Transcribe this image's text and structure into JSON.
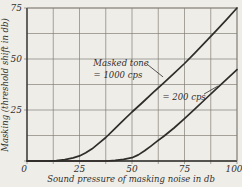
{
  "figure": {
    "paper_color": "#efede8",
    "ink_color": "#2f2d2a",
    "grid_color": "#827f76"
  },
  "chart_data": {
    "type": "line",
    "title": "",
    "xlabel": "Sound pressure of masking noise in db",
    "ylabel": "Masking (threshold shift in db)",
    "xlim": [
      0,
      100
    ],
    "ylim": [
      0,
      75
    ],
    "x_tick_labels": [
      0,
      25,
      50,
      75,
      100
    ],
    "y_tick_labels": [
      25,
      50,
      75
    ],
    "grid": true,
    "grid_step": 12.5,
    "legend_position": "inline-annotations",
    "series": [
      {
        "name": "Masked tone = 1000 cps",
        "points": [
          [
            0,
            0
          ],
          [
            10,
            0
          ],
          [
            14,
            0.2
          ],
          [
            18,
            0.7
          ],
          [
            22,
            1.5
          ],
          [
            25,
            2.5
          ],
          [
            28,
            4
          ],
          [
            31,
            6
          ],
          [
            34,
            8.5
          ],
          [
            37.5,
            11.5
          ],
          [
            41,
            15
          ],
          [
            45,
            19
          ],
          [
            50,
            24
          ],
          [
            55,
            28.7
          ],
          [
            60,
            33.5
          ],
          [
            65,
            38.2
          ],
          [
            70,
            43
          ],
          [
            75,
            47.8
          ],
          [
            80,
            53
          ],
          [
            85,
            58.4
          ],
          [
            90,
            63.8
          ],
          [
            95,
            69.3
          ],
          [
            100,
            75
          ]
        ]
      },
      {
        "name": "= 200 cps",
        "points": [
          [
            0,
            0
          ],
          [
            38,
            0
          ],
          [
            42,
            0.3
          ],
          [
            46,
            0.8
          ],
          [
            50,
            1.6
          ],
          [
            53,
            3
          ],
          [
            56,
            5
          ],
          [
            59,
            7.3
          ],
          [
            62,
            9.7
          ],
          [
            65,
            12
          ],
          [
            70,
            16.2
          ],
          [
            75,
            20.8
          ],
          [
            80,
            25.6
          ],
          [
            85,
            30.4
          ],
          [
            90,
            35.2
          ],
          [
            95,
            40
          ],
          [
            100,
            44.8
          ]
        ]
      }
    ],
    "annotations": [
      {
        "id": "masked-tone-1000-label",
        "lines": [
          {
            "text": "Masked tone",
            "x": 44.8,
            "y": 48.0
          },
          {
            "text": "= 1000 cps",
            "x": 43.3,
            "y": 42.2
          }
        ],
        "leader": {
          "x1": 57.1,
          "y1": 47.5,
          "x2": 64.8,
          "y2": 41.2
        }
      },
      {
        "id": "masked-tone-200-label",
        "lines": [
          {
            "text": "= 200 cps",
            "x": 74.8,
            "y": 31.4
          }
        ],
        "leader": {
          "x1": 84.3,
          "y1": 32.8,
          "x2": 91.0,
          "y2": 36.8
        }
      }
    ]
  }
}
